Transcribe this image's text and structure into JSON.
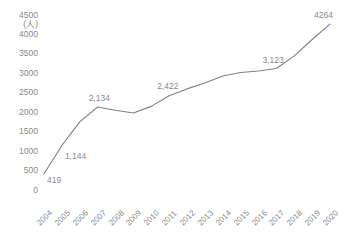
{
  "chart_data": {
    "type": "line",
    "title": "",
    "xlabel": "",
    "ylabel": "",
    "unit_label": "(人)",
    "categories": [
      "2004",
      "2005",
      "2006",
      "2007",
      "2008",
      "2009",
      "2010",
      "2011",
      "2012",
      "2013",
      "2014",
      "2015",
      "2016",
      "2017",
      "2018",
      "2019",
      "2020"
    ],
    "values": [
      419,
      1144,
      1750,
      2134,
      2050,
      1980,
      2150,
      2422,
      2600,
      2750,
      2930,
      3020,
      3060,
      3123,
      3450,
      3870,
      4264
    ],
    "data_labels": [
      {
        "category": "2004",
        "value": 419,
        "text": "419"
      },
      {
        "category": "2005",
        "value": 1144,
        "text": "1,144"
      },
      {
        "category": "2007",
        "value": 2134,
        "text": "2,134"
      },
      {
        "category": "2011",
        "value": 2422,
        "text": "2,422"
      },
      {
        "category": "2017",
        "value": 3123,
        "text": "3,123"
      },
      {
        "category": "2020",
        "value": 4264,
        "text": "4264"
      }
    ],
    "ylim": [
      0,
      4500
    ],
    "yticks": [
      0,
      500,
      1000,
      1500,
      2000,
      2500,
      3000,
      3500,
      4000,
      4500
    ],
    "ytick_labels": [
      "0",
      "500",
      "1000",
      "1500",
      "2000",
      "2500",
      "3000",
      "3500",
      "4000",
      "4500"
    ],
    "grid": false,
    "legend": false,
    "legend_position": "none",
    "series_color": "#808080",
    "text_color": "#8a8a8a",
    "xtick_rotation": -45
  }
}
